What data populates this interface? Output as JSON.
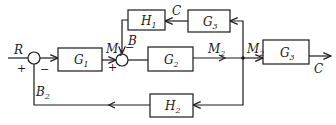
{
  "diagram": {
    "type": "block-diagram",
    "blocks": {
      "g1": {
        "name": "G",
        "sub": "1"
      },
      "g2": {
        "name": "G",
        "sub": "2"
      },
      "g3_feedback": {
        "name": "G",
        "sub": "3"
      },
      "g3_forward": {
        "name": "G",
        "sub": "3"
      },
      "h1": {
        "name": "H",
        "sub": "1"
      },
      "h2": {
        "name": "H",
        "sub": "2"
      }
    },
    "signals": {
      "input": "R",
      "output": "C",
      "feedback_c": "C",
      "b": "B",
      "b2": {
        "name": "B",
        "sub": "2"
      },
      "m1": {
        "name": "M",
        "sub": "1"
      },
      "m2_a": {
        "name": "M",
        "sub": "2"
      },
      "m2_b": {
        "name": "M",
        "sub": "2"
      }
    },
    "signs": {
      "sum1_plus": "+",
      "sum1_minus": "−",
      "sum2_plus": "+",
      "sum2_minus": "−"
    }
  }
}
